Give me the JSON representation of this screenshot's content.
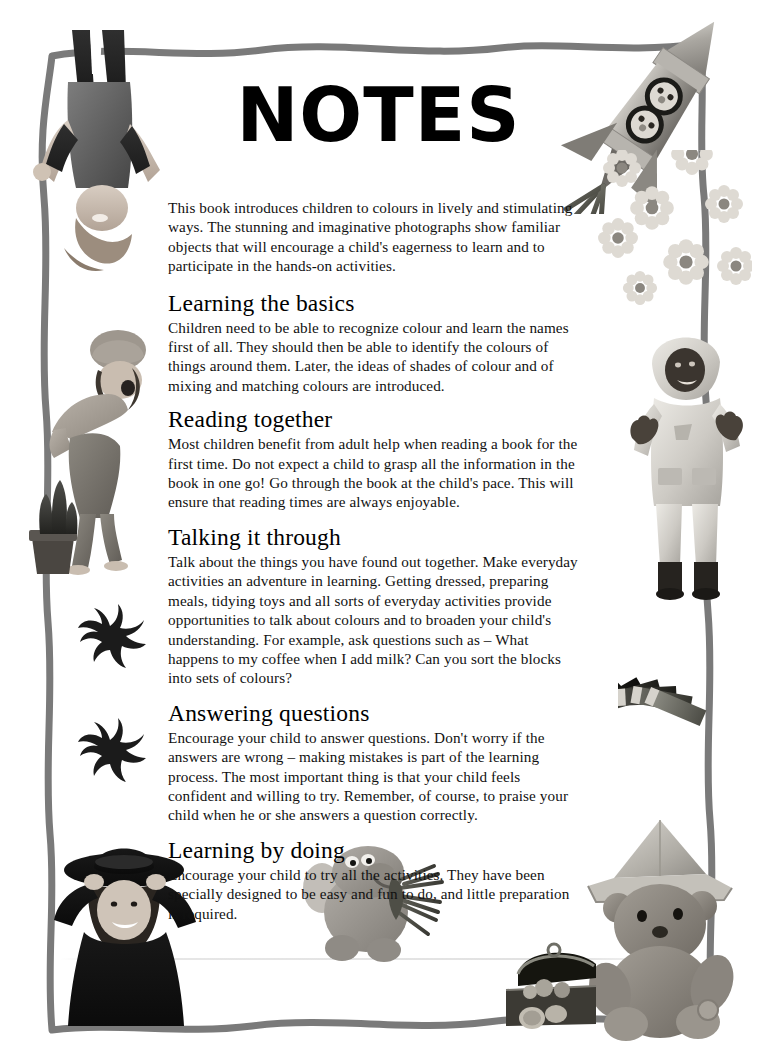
{
  "page": {
    "title": "NOTES",
    "intro": "This book introduces children to colours in lively and stimulating ways. The stunning and imaginative photographs show familiar objects that will encourage a child's eagerness to learn and to participate in the hands-on activities.",
    "sections": [
      {
        "heading": "Learning the basics",
        "body": "Children need to be able to recognize colour and learn the names first of all. They should then be able to identify the colours of things around them. Later, the ideas of shades of colour and of mixing and matching colours are introduced."
      },
      {
        "heading": "Reading together",
        "body": "Most children benefit from adult help when reading a book for the first time. Do not expect a child to grasp all the information in the book in one go! Go through the book at the child's pace. This will ensure that reading times are always enjoyable."
      },
      {
        "heading": "Talking it through",
        "body": "Talk about the things you have found out together. Make everyday activities an adventure in learning. Getting dressed, preparing meals, tidying toys and all sorts of everyday activities provide opportunities to talk about colours and to broaden your child's understanding. For example, ask questions such as – What happens to my coffee when I add milk? Can you sort the blocks into sets of colours?"
      },
      {
        "heading": "Answering questions",
        "body": "Encourage your child to answer questions. Don't worry if the answers are wrong – making mistakes is part of the learning process. The most important thing is that your child feels confident and willing to try. Remember, of course, to praise your child when he or she answers a question correctly."
      },
      {
        "heading": "Learning by doing",
        "body": "Encourage your child to try all the activities. They have been specially designed to be easy and fun to do, and little preparation is required."
      }
    ]
  },
  "decorations": [
    {
      "name": "child-upside-down-photo",
      "description": "Black and white photo of a child in dungarees jumping, shown upside down"
    },
    {
      "name": "child-cactus-photo",
      "description": "Child in a hat recoiling from a potted cactus"
    },
    {
      "name": "crab-silhouette-upper",
      "description": "Black crab silhouette"
    },
    {
      "name": "crab-silhouette-lower",
      "description": "Black crab silhouette"
    },
    {
      "name": "child-cowboy-hat-photo",
      "description": "Smiling child wearing a black cowboy hat"
    },
    {
      "name": "elephant-plush-toy",
      "description": "Grey plush elephant toy holding green tinsel"
    },
    {
      "name": "teddy-bear-photo",
      "description": "Teddy bear wearing a folded paper hat"
    },
    {
      "name": "treasure-chest-photo",
      "description": "Toy treasure chest filled with coins"
    },
    {
      "name": "toy-rocket-photo",
      "description": "Silver toy rocket with teddy bears in portholes and tinsel exhaust"
    },
    {
      "name": "flowers-photo",
      "description": "Cluster of pale daisy flowers"
    },
    {
      "name": "child-rain-suit-photo",
      "description": "Child in a pale hooded rain suit with arms raised"
    },
    {
      "name": "pencil-fan-photo",
      "description": "Fan of coloured pencils arranged in an arc"
    }
  ],
  "style": {
    "border_color": "#7a7a7a",
    "background": "#ffffff",
    "text_color": "#111111"
  }
}
